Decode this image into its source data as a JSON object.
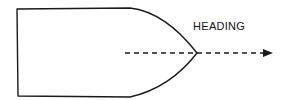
{
  "diagram": {
    "heading_label": "HEADING",
    "colors": {
      "stroke": "#1a1a1a",
      "background": "#ffffff"
    }
  }
}
